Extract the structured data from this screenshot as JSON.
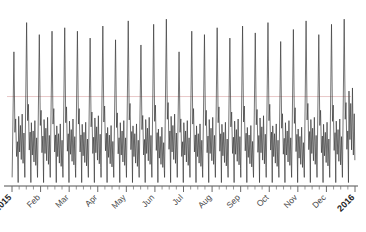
{
  "chart_data": {
    "type": "line",
    "title": "",
    "subtitle": "",
    "xlabel": "",
    "ylabel": "",
    "grid": false,
    "legend": "none",
    "x_tick_labels": [
      "2015",
      "Feb",
      "Mar",
      "Apr",
      "May",
      "Jun",
      "Jul",
      "Aug",
      "Sep",
      "Oct",
      "Nov",
      "Dec",
      "2016"
    ],
    "x_tick_label_rotation": -45,
    "x_tick_label_bold": [
      true,
      false,
      false,
      false,
      false,
      false,
      false,
      false,
      false,
      false,
      false,
      false,
      true
    ],
    "x_axis_range": [
      "2015-01-01",
      "2016-01-07"
    ],
    "y_axis_visible": false,
    "ylim": [
      0,
      100
    ],
    "reference_line": {
      "y": 52,
      "style": "solid",
      "color": "#e8c8c8",
      "label": ""
    },
    "series": [
      {
        "name": "weekly series",
        "color": "#3a3a3a",
        "width": 0.7,
        "seasonal_period_days": 7,
        "description": "Strong weekly seasonality: one tall spike per week, with a much taller spike roughly every other week; troughs near zero between weeks.",
        "peak_values": [
          78,
          95,
          88,
          90,
          92,
          90,
          86,
          93,
          85,
          96,
          82,
          94,
          97
        ],
        "minor_peak_values": [
          44,
          40,
          38,
          41,
          36
        ],
        "trough_value": 2,
        "x": [
          "2015-01-01",
          "2015-01-08",
          "2015-01-15",
          "2015-01-22",
          "2015-01-29",
          "2015-02-05",
          "2015-02-12",
          "2015-02-19",
          "2015-02-26",
          "2015-03-05",
          "2015-03-12",
          "2015-03-19",
          "2015-03-26",
          "2015-04-02",
          "2015-04-09",
          "2015-04-16",
          "2015-04-23",
          "2015-04-30",
          "2015-05-07",
          "2015-05-14",
          "2015-05-21",
          "2015-05-28",
          "2015-06-04",
          "2015-06-11",
          "2015-06-18",
          "2015-06-25",
          "2015-07-02",
          "2015-07-09",
          "2015-07-16",
          "2015-07-23",
          "2015-07-30",
          "2015-08-06",
          "2015-08-13",
          "2015-08-20",
          "2015-08-27",
          "2015-09-03",
          "2015-09-10",
          "2015-09-17",
          "2015-09-24",
          "2015-10-01",
          "2015-10-08",
          "2015-10-15",
          "2015-10-22",
          "2015-10-29",
          "2015-11-05",
          "2015-11-12",
          "2015-11-19",
          "2015-11-26",
          "2015-12-03",
          "2015-12-10",
          "2015-12-17",
          "2015-12-24",
          "2015-12-31",
          "2016-01-07"
        ],
        "values": [
          78,
          44,
          95,
          40,
          88,
          42,
          90,
          38,
          92,
          41,
          90,
          39,
          86,
          43,
          93,
          37,
          85,
          40,
          96,
          38,
          82,
          42,
          94,
          36,
          97,
          44,
          78,
          40,
          90,
          38,
          88,
          42,
          92,
          39,
          86,
          41,
          93,
          37,
          89,
          43,
          95,
          38,
          84,
          40,
          91,
          36,
          96,
          42,
          88,
          39,
          94,
          41,
          97,
          60
        ]
      }
    ]
  },
  "axis": {
    "baseline_color": "#8a8a8a",
    "tick_color": "#6a6a6a",
    "minor_ticks_per_month": 4
  }
}
